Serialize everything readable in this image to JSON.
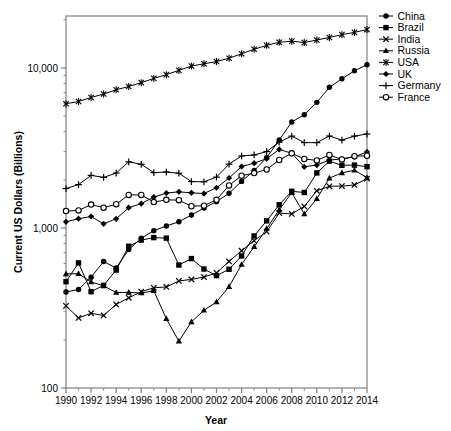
{
  "chart_data": {
    "type": "line",
    "title": "",
    "xlabel": "Year",
    "ylabel": "Current US Dollars (Billions)",
    "xlim": [
      1990,
      2014
    ],
    "ylim": [
      100,
      20000
    ],
    "yscale": "log",
    "grid": false,
    "legend_position": "top-right-outside",
    "x": [
      1990,
      1991,
      1992,
      1993,
      1994,
      1995,
      1996,
      1997,
      1998,
      1999,
      2000,
      2001,
      2002,
      2003,
      2004,
      2005,
      2006,
      2007,
      2008,
      2009,
      2010,
      2011,
      2012,
      2013,
      2014
    ],
    "ytick_labels": [
      "100",
      "1,000",
      "10,000"
    ],
    "ytick_values": [
      100,
      1000,
      10000
    ],
    "xtick_labels": [
      "1990",
      "1992",
      "1994",
      "1996",
      "1998",
      "2000",
      "2002",
      "2004",
      "2006",
      "2008",
      "2010",
      "2012",
      "2014"
    ],
    "xtick_values": [
      1990,
      1992,
      1994,
      1996,
      1998,
      2000,
      2002,
      2004,
      2006,
      2008,
      2010,
      2012,
      2014
    ],
    "xminor_values": [
      1991,
      1993,
      1995,
      1997,
      1999,
      2001,
      2003,
      2005,
      2007,
      2009,
      2011,
      2013
    ],
    "series": [
      {
        "name": "China",
        "marker": "filled-circle",
        "values": [
          398,
          413,
          493,
          617,
          562,
          734,
          863,
          962,
          1029,
          1094,
          1205,
          1332,
          1461,
          1650,
          1955,
          2286,
          2752,
          3552,
          4598,
          5110,
          6101,
          7573,
          8561,
          9607,
          10482
        ]
      },
      {
        "name": "Brazil",
        "marker": "filled-square",
        "values": [
          462,
          605,
          400,
          438,
          546,
          769,
          840,
          871,
          864,
          587,
          644,
          554,
          504,
          552,
          669,
          892,
          1108,
          1397,
          1696,
          1667,
          2209,
          2616,
          2465,
          2473,
          2417
        ]
      },
      {
        "name": "India",
        "marker": "x-cross",
        "values": [
          326,
          274,
          293,
          284,
          333,
          366,
          400,
          423,
          428,
          467,
          477,
          494,
          524,
          618,
          721,
          834,
          949,
          1239,
          1224,
          1365,
          1708,
          1823,
          1828,
          1857,
          2035
        ]
      },
      {
        "name": "Russia",
        "marker": "filled-triangle",
        "values": [
          517,
          518,
          460,
          435,
          395,
          396,
          392,
          405,
          271,
          196,
          259,
          306,
          345,
          430,
          591,
          764,
          990,
          1300,
          1661,
          1223,
          1525,
          2051,
          2210,
          2297,
          2064
        ]
      },
      {
        "name": "USA",
        "marker": "asterisk",
        "values": [
          5980,
          6174,
          6539,
          6879,
          7309,
          7664,
          8100,
          8609,
          9089,
          9661,
          10285,
          10622,
          10978,
          11511,
          12275,
          13094,
          13856,
          14478,
          14719,
          14419,
          14964,
          15518,
          16155,
          16692,
          17393
        ]
      },
      {
        "name": "UK",
        "marker": "filled-diamond",
        "values": [
          1093,
          1143,
          1180,
          1062,
          1142,
          1339,
          1422,
          1560,
          1652,
          1684,
          1658,
          1642,
          1785,
          2053,
          2421,
          2543,
          2713,
          3100,
          2929,
          2413,
          2475,
          2659,
          2704,
          2786,
          2989
        ]
      },
      {
        "name": "Germany",
        "marker": "plus",
        "values": [
          1765,
          1867,
          2132,
          2071,
          2205,
          2592,
          2501,
          2219,
          2237,
          2199,
          1950,
          1945,
          2079,
          2506,
          2819,
          2861,
          3003,
          3439,
          3752,
          3418,
          3417,
          3757,
          3544,
          3753,
          3868
        ]
      },
      {
        "name": "France",
        "marker": "open-circle",
        "values": [
          1275,
          1288,
          1400,
          1340,
          1408,
          1610,
          1610,
          1452,
          1500,
          1493,
          1368,
          1378,
          1501,
          1845,
          2124,
          2203,
          2321,
          2660,
          2931,
          2700,
          2646,
          2863,
          2681,
          2809,
          2829
        ]
      }
    ]
  },
  "legend": {
    "items": [
      {
        "label": "China"
      },
      {
        "label": "Brazil"
      },
      {
        "label": "India"
      },
      {
        "label": "Russia"
      },
      {
        "label": "USA"
      },
      {
        "label": "UK"
      },
      {
        "label": "Germany"
      },
      {
        "label": "France"
      }
    ]
  },
  "colors": {
    "line": "#000000",
    "axis": "#808080",
    "background": "#ffffff"
  }
}
